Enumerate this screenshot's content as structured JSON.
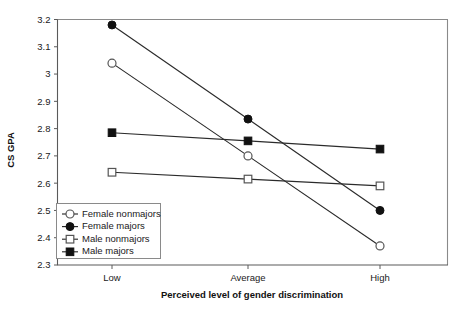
{
  "chart_data": {
    "type": "line",
    "title": "",
    "xlabel": "Perceived level of gender discrimination",
    "ylabel": "CS GPA",
    "categories": [
      "Low",
      "Average",
      "High"
    ],
    "ylim": [
      2.3,
      3.2
    ],
    "ytick_labels": [
      "3.2",
      "3.1",
      "3",
      "2.9",
      "2.8",
      "2.7",
      "2.6",
      "2.5",
      "2.4",
      "2.3"
    ],
    "ytick_values": [
      3.2,
      3.1,
      3.0,
      2.9,
      2.8,
      2.7,
      2.6,
      2.5,
      2.4,
      2.3
    ],
    "grid": false,
    "legend_position": "lower-left-inside",
    "series": [
      {
        "name": "Female nonmajors",
        "marker": "open-circle",
        "values": [
          3.04,
          2.7,
          2.37
        ]
      },
      {
        "name": "Female majors",
        "marker": "filled-circle",
        "values": [
          3.18,
          2.835,
          2.5
        ]
      },
      {
        "name": "Male nonmajors",
        "marker": "open-square",
        "values": [
          2.64,
          2.615,
          2.59
        ]
      },
      {
        "name": "Male majors",
        "marker": "filled-square",
        "values": [
          2.785,
          2.755,
          2.725
        ]
      }
    ]
  },
  "legend": {
    "items": [
      {
        "label": "Female nonmajors"
      },
      {
        "label": "Female majors"
      },
      {
        "label": "Male nonmajors"
      },
      {
        "label": "Male majors"
      }
    ]
  },
  "colors": {
    "line": "#2b2b2b",
    "marker_fill": "#111111",
    "marker_open_fill": "#ffffff",
    "axis": "#5a5a5a",
    "frame": "#8a8a8a",
    "background": "#ffffff"
  }
}
